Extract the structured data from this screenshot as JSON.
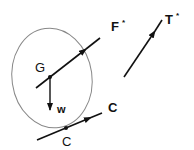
{
  "diagram": {
    "colors": {
      "stroke": "#111111",
      "ellipse": "#888888",
      "background": "#ffffff"
    },
    "body": {
      "shape": "ellipse",
      "cx": 52,
      "cy": 78,
      "rx": 40,
      "ry": 50,
      "rotate": -8
    },
    "labels": {
      "F": "F",
      "F_star": "*",
      "T": "T",
      "T_star": "*",
      "G": "G",
      "w": "w",
      "C_vector": "C",
      "C_point": "C"
    },
    "vectors": [
      {
        "name": "F*",
        "x1": 36,
        "y1": 88,
        "x2": 100,
        "y2": 38,
        "arrow_at": 0.78
      },
      {
        "name": "T*",
        "x1": 124,
        "y1": 77,
        "x2": 162,
        "y2": 20,
        "arrow_at": 0.82
      },
      {
        "name": "w",
        "x1": 50,
        "y1": 77,
        "x2": 50,
        "y2": 110,
        "arrow_at": 1.0
      },
      {
        "name": "C",
        "x1": 37,
        "y1": 140,
        "x2": 102,
        "y2": 113,
        "arrow_at": 0.8
      }
    ],
    "points": [
      {
        "name": "G",
        "x": 50,
        "y": 77
      },
      {
        "name": "C",
        "x": 66,
        "y": 128
      }
    ]
  }
}
